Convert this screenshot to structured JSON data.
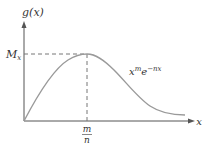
{
  "figure": {
    "y_axis_label": "g(x)",
    "x_axis_label": "x",
    "max_label": "M",
    "max_label_sub": "x",
    "peak_x_num": "m",
    "peak_x_den": "n",
    "curve_label_base": "x",
    "curve_label_exp1": "m",
    "curve_label_e": "e",
    "curve_label_exp2": "−nx"
  },
  "colors": {
    "axis": "#555555",
    "curve": "#9a9a9a",
    "dash": "#777777",
    "text": "#333333"
  }
}
